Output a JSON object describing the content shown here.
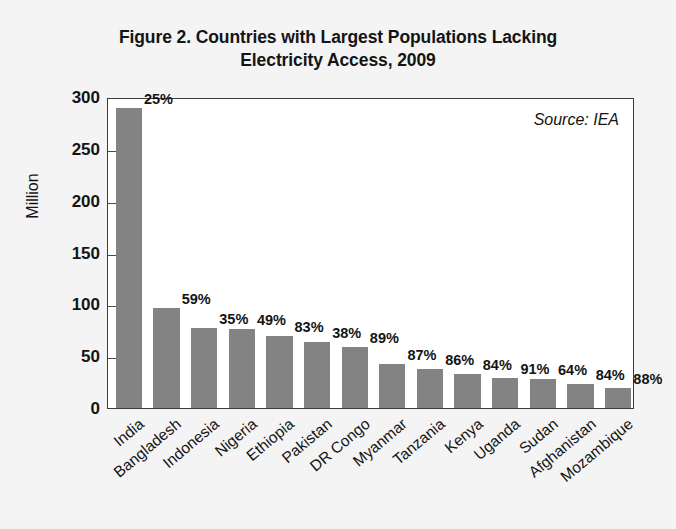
{
  "figure": {
    "title_line1": "Figure 2. Countries with Largest Populations Lacking",
    "title_line2": "Electricity Access, 2009",
    "source_note": "Source: IEA",
    "background_color": "#f4f4f4",
    "plot_background_color": "#ffffff",
    "bar_color": "#838383",
    "axis_color": "#3c3c3c",
    "text_color": "#141414"
  },
  "chart_data": {
    "type": "bar",
    "title": "Figure 2. Countries with Largest Populations Lacking Electricity Access, 2009",
    "subtitle": "",
    "xlabel": "",
    "ylabel": "Million",
    "ylim": [
      0,
      300
    ],
    "yticks": [
      0,
      50,
      100,
      150,
      200,
      250,
      300
    ],
    "ytick_labels": [
      "0",
      "50",
      "100",
      "150",
      "200",
      "250",
      "300"
    ],
    "grid": false,
    "legend": null,
    "annotations": [
      "Source: IEA"
    ],
    "categories": [
      "India",
      "Bangladesh",
      "Indonesia",
      "Nigeria",
      "Ethiopia",
      "Pakistan",
      "DR Congo",
      "Myanmar",
      "Tanzania",
      "Kenya",
      "Uganda",
      "Sudan",
      "Afghanistan",
      "Mozambique"
    ],
    "values": [
      289,
      96,
      77,
      76,
      69,
      64,
      59,
      42,
      38,
      33,
      29,
      28,
      23,
      19
    ],
    "data_labels": [
      "25%",
      "59%",
      "35%",
      "49%",
      "83%",
      "38%",
      "89%",
      "87%",
      "86%",
      "84%",
      "91%",
      "64%",
      "84%",
      "88%"
    ],
    "data_label_meaning": "share of national population lacking electricity access",
    "units": "Million people"
  }
}
